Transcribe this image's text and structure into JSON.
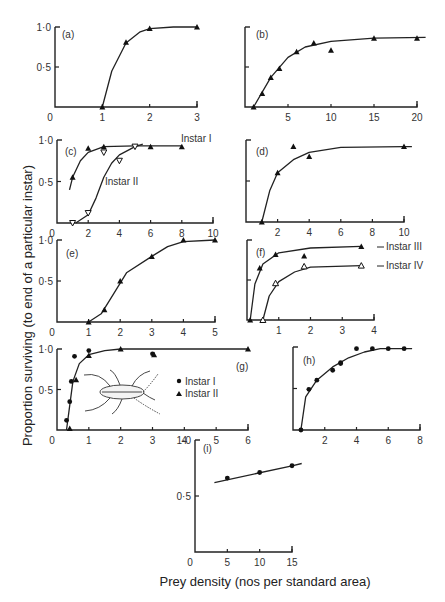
{
  "figure": {
    "y_axis_label": "Proportion surviving (to end of a particular instar)",
    "x_axis_label": "Prey density (nos per standard area)"
  },
  "chart_data": [
    {
      "panel": "(a)",
      "type": "line",
      "x_ticks": [
        "0",
        "1",
        "2",
        "3"
      ],
      "y_ticks": [
        "0",
        "0·5",
        "1·0"
      ],
      "xlim": [
        0,
        3
      ],
      "ylim": [
        0,
        1
      ],
      "series": [
        {
          "name": "",
          "marker": "filled-triangle",
          "points": [
            [
              1,
              0.0
            ],
            [
              1.5,
              0.81
            ],
            [
              2,
              0.98
            ],
            [
              3,
              1.0
            ]
          ],
          "curve": [
            [
              1,
              0
            ],
            [
              1.2,
              0.45
            ],
            [
              1.5,
              0.8
            ],
            [
              1.8,
              0.94
            ],
            [
              2,
              0.98
            ],
            [
              2.5,
              1.0
            ],
            [
              3,
              1.0
            ]
          ]
        }
      ]
    },
    {
      "panel": "(b)",
      "type": "line",
      "x_ticks": [
        "5",
        "10",
        "15",
        "20"
      ],
      "y_ticks": [],
      "xlim": [
        0,
        22
      ],
      "ylim": [
        0,
        1
      ],
      "series": [
        {
          "name": "",
          "marker": "filled-triangle",
          "points": [
            [
              1,
              0.0
            ],
            [
              2,
              0.35
            ],
            [
              3,
              0.74
            ],
            [
              4,
              0.97
            ],
            [
              6,
              1.37
            ],
            [
              8,
              1.6
            ],
            [
              10,
              1.42
            ],
            [
              15,
              1.72
            ],
            [
              20,
              1.72
            ]
          ],
          "normalized_points": [
            [
              1,
              0.0
            ],
            [
              2,
              0.17
            ],
            [
              3,
              0.37
            ],
            [
              4,
              0.48
            ],
            [
              6,
              0.69
            ],
            [
              8,
              0.8
            ],
            [
              10,
              0.71
            ],
            [
              15,
              0.86
            ],
            [
              20,
              0.86
            ]
          ],
          "curve": [
            [
              1,
              0
            ],
            [
              3,
              0.37
            ],
            [
              5,
              0.62
            ],
            [
              7,
              0.75
            ],
            [
              10,
              0.82
            ],
            [
              15,
              0.86
            ],
            [
              21,
              0.87
            ]
          ]
        }
      ]
    },
    {
      "panel": "(c)",
      "type": "line",
      "x_ticks": [
        "0",
        "2",
        "4",
        "6",
        "8",
        "10"
      ],
      "y_ticks": [
        "0·5",
        "1·0"
      ],
      "xlim": [
        0,
        10
      ],
      "ylim": [
        0,
        1
      ],
      "series": [
        {
          "name": "Instar I",
          "marker": "filled-triangle",
          "points": [
            [
              1,
              0.55
            ],
            [
              2,
              0.9
            ],
            [
              3,
              0.92
            ],
            [
              6,
              0.92
            ],
            [
              8,
              0.92
            ]
          ],
          "curve": [
            [
              0.8,
              0.4
            ],
            [
              1,
              0.55
            ],
            [
              1.5,
              0.75
            ],
            [
              2,
              0.85
            ],
            [
              3,
              0.92
            ],
            [
              5,
              0.93
            ],
            [
              8,
              0.93
            ]
          ]
        },
        {
          "name": "Instar II",
          "marker": "open-triangle-down",
          "points": [
            [
              1,
              0.0
            ],
            [
              2,
              0.12
            ],
            [
              3,
              0.85
            ],
            [
              4,
              0.75
            ],
            [
              5,
              0.92
            ]
          ],
          "curve": [
            [
              1.2,
              0
            ],
            [
              2,
              0.1
            ],
            [
              2.5,
              0.3
            ],
            [
              3,
              0.55
            ],
            [
              3.5,
              0.72
            ],
            [
              4,
              0.82
            ],
            [
              5,
              0.92
            ],
            [
              5.5,
              0.95
            ]
          ]
        }
      ]
    },
    {
      "panel": "(d)",
      "type": "line",
      "x_ticks": [
        "2",
        "4",
        "6",
        "8",
        "10"
      ],
      "y_ticks": [],
      "xlim": [
        0,
        10
      ],
      "ylim": [
        0,
        1
      ],
      "series": [
        {
          "name": "",
          "marker": "filled-triangle",
          "points": [
            [
              1,
              0.0
            ],
            [
              2,
              0.6
            ],
            [
              3,
              0.92
            ],
            [
              4,
              0.8
            ],
            [
              10,
              0.92
            ]
          ],
          "curve": [
            [
              1,
              0
            ],
            [
              1.5,
              0.38
            ],
            [
              2,
              0.6
            ],
            [
              3,
              0.76
            ],
            [
              4,
              0.85
            ],
            [
              6,
              0.91
            ],
            [
              10,
              0.92
            ],
            [
              10.5,
              0.92
            ]
          ]
        }
      ]
    },
    {
      "panel": "(e)",
      "type": "line",
      "x_ticks": [
        "0",
        "1",
        "2",
        "3",
        "4",
        "5"
      ],
      "y_ticks": [
        "0·5",
        "1·0"
      ],
      "xlim": [
        0,
        5
      ],
      "ylim": [
        0,
        1
      ],
      "series": [
        {
          "name": "",
          "marker": "filled-triangle",
          "points": [
            [
              1,
              0.0
            ],
            [
              1.5,
              0.15
            ],
            [
              2,
              0.5
            ],
            [
              3,
              0.8
            ],
            [
              4,
              1.0
            ],
            [
              5,
              1.0
            ]
          ],
          "curve": [
            [
              1,
              0
            ],
            [
              1.4,
              0.1
            ],
            [
              1.8,
              0.35
            ],
            [
              2.2,
              0.6
            ],
            [
              3,
              0.8
            ],
            [
              3.5,
              0.92
            ],
            [
              4,
              0.98
            ],
            [
              5,
              1.0
            ]
          ]
        }
      ]
    },
    {
      "panel": "(f)",
      "type": "line",
      "x_ticks": [
        "1",
        "2",
        "3",
        "4"
      ],
      "y_ticks": [],
      "xlim": [
        0,
        4
      ],
      "ylim": [
        0,
        1
      ],
      "series": [
        {
          "name": "Instar III",
          "marker": "filled-triangle",
          "points": [
            [
              0.1,
              0.0
            ],
            [
              0.4,
              0.65
            ],
            [
              0.9,
              0.82
            ],
            [
              1.8,
              0.8
            ],
            [
              3.6,
              0.92
            ]
          ],
          "curve": [
            [
              0.1,
              0
            ],
            [
              0.25,
              0.45
            ],
            [
              0.5,
              0.7
            ],
            [
              1,
              0.84
            ],
            [
              2,
              0.9
            ],
            [
              3.6,
              0.92
            ]
          ]
        },
        {
          "name": "Instar IV",
          "marker": "open-triangle",
          "points": [
            [
              0.5,
              0.0
            ],
            [
              0.9,
              0.46
            ],
            [
              1.8,
              0.67
            ],
            [
              3.6,
              0.68
            ]
          ],
          "curve": [
            [
              0.5,
              0
            ],
            [
              0.7,
              0.3
            ],
            [
              1,
              0.48
            ],
            [
              1.5,
              0.6
            ],
            [
              2,
              0.66
            ],
            [
              3.6,
              0.68
            ]
          ]
        }
      ]
    },
    {
      "panel": "(g)",
      "type": "line",
      "x_ticks": [
        "0",
        "1",
        "2",
        "3",
        "4",
        "5",
        "6"
      ],
      "y_ticks": [
        "0·5",
        "1·0"
      ],
      "xlim": [
        0,
        6
      ],
      "ylim": [
        0,
        1
      ],
      "legend": [
        "Instar I",
        "Instar II"
      ],
      "series": [
        {
          "name": "Instar I",
          "marker": "filled-circle",
          "points": [
            [
              0.3,
              0.12
            ],
            [
              0.4,
              0.35
            ],
            [
              0.45,
              0.6
            ],
            [
              0.55,
              0.91
            ],
            [
              1,
              0.98
            ],
            [
              3,
              0.94
            ]
          ]
        },
        {
          "name": "Instar II",
          "marker": "filled-triangle",
          "points": [
            [
              0.4,
              0.02
            ],
            [
              0.6,
              0.62
            ],
            [
              1,
              0.92
            ],
            [
              2,
              1.0
            ],
            [
              3.05,
              0.93
            ],
            [
              6,
              1.0
            ]
          ]
        }
      ],
      "curve": [
        [
          0.3,
          0
        ],
        [
          0.4,
          0.3
        ],
        [
          0.5,
          0.6
        ],
        [
          0.7,
          0.82
        ],
        [
          1,
          0.93
        ],
        [
          1.5,
          0.98
        ],
        [
          2,
          1.0
        ],
        [
          6,
          1.0
        ]
      ]
    },
    {
      "panel": "(h)",
      "type": "line",
      "x_ticks": [
        "2",
        "4",
        "6",
        "8"
      ],
      "y_ticks": [],
      "xlim": [
        0,
        8
      ],
      "ylim": [
        0,
        1
      ],
      "series": [
        {
          "name": "",
          "marker": "filled-circle",
          "points": [
            [
              0.5,
              0.0
            ],
            [
              1,
              0.49
            ],
            [
              1.5,
              0.6
            ],
            [
              2.5,
              0.72
            ],
            [
              3,
              0.81
            ],
            [
              3,
              0.8
            ],
            [
              4,
              0.98
            ],
            [
              5,
              0.98
            ],
            [
              6,
              0.98
            ],
            [
              7,
              0.98
            ]
          ],
          "curve": [
            [
              0.5,
              0
            ],
            [
              0.8,
              0.4
            ],
            [
              1.5,
              0.6
            ],
            [
              2.5,
              0.76
            ],
            [
              3.5,
              0.87
            ],
            [
              4.5,
              0.94
            ],
            [
              5.5,
              0.98
            ],
            [
              7.5,
              0.98
            ]
          ]
        }
      ]
    },
    {
      "panel": "(i)",
      "type": "line",
      "x_ticks": [
        "0",
        "5",
        "10",
        "15"
      ],
      "y_ticks": [
        "0·5",
        "1·0"
      ],
      "xlim": [
        0,
        15
      ],
      "ylim": [
        0,
        1
      ],
      "series": [
        {
          "name": "",
          "marker": "filled-circle",
          "points": [
            [
              5,
              0.66
            ],
            [
              10,
              0.71
            ],
            [
              15,
              0.77
            ]
          ],
          "curve": [
            [
              3,
              0.62
            ],
            [
              15,
              0.77
            ],
            [
              16.5,
              0.79
            ]
          ]
        }
      ]
    }
  ]
}
